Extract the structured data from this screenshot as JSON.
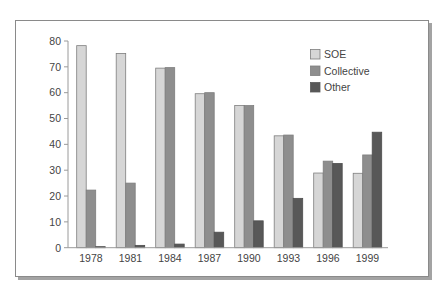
{
  "chart_data": {
    "type": "bar",
    "title": "",
    "xlabel": "",
    "ylabel": "",
    "categories": [
      "1978",
      "1981",
      "1984",
      "1987",
      "1990",
      "1993",
      "1996",
      "1999"
    ],
    "series": [
      {
        "name": "SOE",
        "color": "#d6d6d6",
        "values": [
          78.2,
          75.2,
          69.5,
          59.6,
          55.0,
          43.3,
          28.9,
          28.8
        ]
      },
      {
        "name": "Collective",
        "color": "#8e8e8e",
        "values": [
          22.3,
          25.0,
          69.7,
          60.0,
          55.0,
          43.6,
          33.5,
          35.9
        ]
      },
      {
        "name": "Other",
        "color": "#585858",
        "values": [
          0.4,
          0.9,
          1.4,
          6.0,
          10.4,
          19.1,
          32.6,
          44.7
        ]
      }
    ],
    "ylim": [
      0,
      80
    ],
    "yticks": [
      0,
      10,
      20,
      30,
      40,
      50,
      60,
      70,
      80
    ],
    "grid": false,
    "legend": {
      "position": "upper-right-inside",
      "entries": [
        "SOE",
        "Collective",
        "Other"
      ]
    }
  },
  "style": {
    "bar_outline": "#7e7e7e",
    "axis_color": "#9a9a9a",
    "frame_border": "#8a8a8a",
    "frame_shadow": "#a3a3a3",
    "text_color": "#444444"
  }
}
